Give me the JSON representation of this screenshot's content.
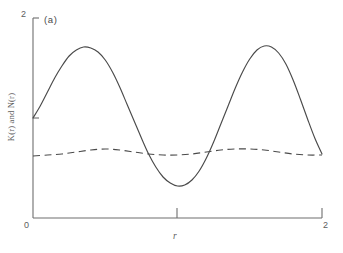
{
  "chart_data": {
    "type": "line",
    "title": "",
    "panel_label": "(a)",
    "xlabel": "r",
    "ylabel": "K(r) and N(r)",
    "xlim": [
      0,
      2
    ],
    "ylim": [
      0,
      2
    ],
    "grid": false,
    "legend": "none",
    "xticks": [
      0,
      1,
      2
    ],
    "xtick_labels": [
      "0",
      "",
      "2"
    ],
    "yticks": [
      0,
      1,
      2
    ],
    "ytick_labels": [
      "0",
      "",
      "2"
    ],
    "series": [
      {
        "name": "K(r)",
        "style": "solid",
        "color": "#4a4a4a",
        "x": [
          0.0,
          0.05,
          0.1,
          0.15,
          0.2,
          0.25,
          0.3,
          0.35,
          0.4,
          0.45,
          0.5,
          0.55,
          0.6,
          0.65,
          0.7,
          0.75,
          0.8,
          0.85,
          0.9,
          0.95,
          1.0,
          1.05,
          1.1,
          1.15,
          1.2,
          1.25,
          1.3,
          1.35,
          1.4,
          1.45,
          1.5,
          1.55,
          1.6,
          1.65,
          1.7,
          1.75,
          1.8,
          1.85,
          1.9,
          1.95,
          2.0
        ],
        "y": [
          1.0,
          1.12,
          1.26,
          1.4,
          1.52,
          1.62,
          1.68,
          1.71,
          1.7,
          1.66,
          1.58,
          1.46,
          1.31,
          1.14,
          0.97,
          0.8,
          0.64,
          0.51,
          0.41,
          0.35,
          0.32,
          0.33,
          0.38,
          0.47,
          0.6,
          0.76,
          0.94,
          1.12,
          1.3,
          1.46,
          1.59,
          1.68,
          1.72,
          1.71,
          1.65,
          1.54,
          1.38,
          1.19,
          0.99,
          0.8,
          0.64
        ]
      },
      {
        "name": "N(r)",
        "style": "dashed",
        "color": "#4a4a4a",
        "x": [
          0.0,
          0.1,
          0.2,
          0.3,
          0.4,
          0.5,
          0.6,
          0.7,
          0.8,
          0.9,
          1.0,
          1.1,
          1.2,
          1.3,
          1.4,
          1.5,
          1.6,
          1.7,
          1.8,
          1.9,
          2.0
        ],
        "y": [
          0.62,
          0.63,
          0.64,
          0.66,
          0.68,
          0.69,
          0.68,
          0.66,
          0.64,
          0.63,
          0.63,
          0.64,
          0.66,
          0.68,
          0.69,
          0.69,
          0.68,
          0.66,
          0.64,
          0.63,
          0.63
        ]
      }
    ]
  },
  "axes": {
    "x_title": "r",
    "y_title": "K(r) and N(r)",
    "x_min_label": "0",
    "x_max_label": "2",
    "y_max_label": "2"
  },
  "panel": {
    "label": "(a)"
  },
  "colors": {
    "axis": "#6e6e6e",
    "curve": "#4a4a4a",
    "text": "#5d5d5d"
  }
}
